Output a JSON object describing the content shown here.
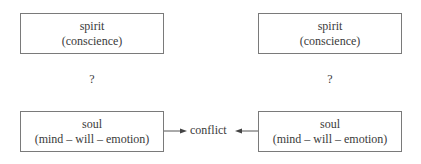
{
  "left": {
    "spirit": {
      "title": "spirit",
      "subtitle": "(conscience)"
    },
    "question": "?",
    "soul": {
      "title": "soul",
      "subtitle": "(mind – will – emotion)"
    }
  },
  "right": {
    "spirit": {
      "title": "spirit",
      "subtitle": "(conscience)"
    },
    "question": "?",
    "soul": {
      "title": "soul",
      "subtitle": "(mind – will – emotion)"
    }
  },
  "center": {
    "label": "conflict"
  },
  "colors": {
    "border": "#7a7a7a",
    "text": "#3a3a3a"
  }
}
